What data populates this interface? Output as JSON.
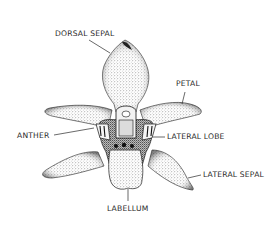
{
  "diagram": {
    "colors": {
      "ink": "#1a1a1a",
      "stipple": "#6a6a6a",
      "background": "#ffffff",
      "label": "#2a2a2a"
    },
    "labels": {
      "dorsal_sepal": "DORSAL SEPAL",
      "petal": "PETAL",
      "anther": "ANTHER",
      "lateral_lobe": "LATERAL LOBE",
      "lateral_sepal": "LATERAL SEPAL",
      "labellum": "LABELLUM"
    }
  }
}
